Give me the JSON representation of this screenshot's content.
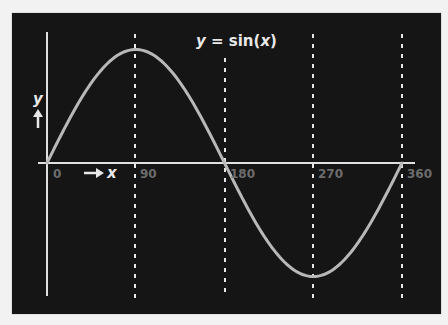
{
  "chart_data": {
    "type": "line",
    "title": "y = sin(x)",
    "xlabel": "x",
    "ylabel": "y",
    "x_ticks": [
      "0",
      "90",
      "180",
      "270",
      "360"
    ],
    "x": [
      0,
      90,
      180,
      270,
      360
    ],
    "series": [
      {
        "name": "sin(x)",
        "values": [
          0,
          1,
          0,
          -1,
          0
        ]
      }
    ],
    "xlim": [
      0,
      360
    ],
    "ylim": [
      -1,
      1
    ],
    "grid": "dashed vertical lines at 90, 180, 270, 360",
    "legend": "none"
  },
  "title": {
    "y": "y",
    "eq": " = sin(",
    "x": "x",
    "close": ")"
  },
  "axis": {
    "y_label": "y",
    "x_label": "x"
  },
  "ticks": {
    "t0": "0",
    "t90": "90",
    "t180": "180",
    "t270": "270",
    "t360": "360"
  },
  "colors": {
    "panel": "#151515",
    "curve": "#b8b8b8",
    "axes": "#e0e0e0",
    "tick_labels": "#6c6c6c",
    "dashes": "#e6e6e6"
  }
}
